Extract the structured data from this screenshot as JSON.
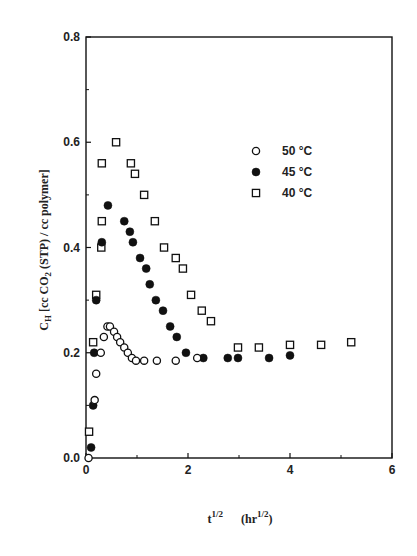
{
  "chart_data": {
    "type": "scatter",
    "title": "",
    "xlabel": "t^1/2 (hr^1/2)",
    "xlabel_parts": {
      "base": "t",
      "sup1": "1/2",
      "unit_base": "(hr",
      "sup2": "1/2",
      "unit_close": ")"
    },
    "ylabel": "C_H [cc CO2 (STP) / cc polymer]",
    "ylabel_parts": {
      "sym": "C",
      "sub": "H",
      "rest": " [cc CO",
      "sub2": "2",
      "rest2": " (STP) / cc polymer]"
    },
    "xlim": [
      0,
      6
    ],
    "ylim": [
      0.0,
      0.8
    ],
    "x_ticks": [
      0,
      2,
      4,
      6
    ],
    "x_minor_ticks": [
      1,
      3,
      5
    ],
    "y_ticks": [
      0.0,
      0.2,
      0.4,
      0.6,
      0.8
    ],
    "y_tick_labels": [
      "0.0",
      "0.2",
      "0.4",
      "0.6",
      "0.8"
    ],
    "y_minor_ticks": [
      0.1,
      0.3,
      0.5,
      0.7
    ],
    "grid": false,
    "legend_position": "upper right (inside)",
    "series": [
      {
        "name": "50 °C",
        "marker": "open-circle",
        "x": [
          0.05,
          0.17,
          0.2,
          0.29,
          0.35,
          0.42,
          0.47,
          0.55,
          0.61,
          0.67,
          0.75,
          0.82,
          0.9,
          0.98,
          1.14,
          1.39,
          1.76,
          2.18
        ],
        "y": [
          0.0,
          0.11,
          0.16,
          0.2,
          0.23,
          0.25,
          0.25,
          0.24,
          0.23,
          0.22,
          0.21,
          0.2,
          0.19,
          0.185,
          0.185,
          0.185,
          0.185,
          0.19
        ]
      },
      {
        "name": "45 °C",
        "marker": "filled-circle",
        "x": [
          0.1,
          0.14,
          0.16,
          0.2,
          0.31,
          0.43,
          0.75,
          0.86,
          0.92,
          1.06,
          1.18,
          1.25,
          1.37,
          1.51,
          1.65,
          1.78,
          1.96,
          2.3,
          2.78,
          2.98,
          3.59,
          4.0
        ],
        "y": [
          0.02,
          0.1,
          0.2,
          0.3,
          0.41,
          0.48,
          0.45,
          0.43,
          0.41,
          0.38,
          0.36,
          0.33,
          0.3,
          0.28,
          0.25,
          0.23,
          0.2,
          0.19,
          0.19,
          0.19,
          0.19,
          0.195
        ]
      },
      {
        "name": "40 °C",
        "marker": "open-square",
        "x": [
          0.06,
          0.14,
          0.2,
          0.3,
          0.31,
          0.31,
          0.59,
          0.88,
          0.96,
          1.14,
          1.35,
          1.53,
          1.76,
          1.9,
          2.06,
          2.27,
          2.45,
          2.98,
          3.39,
          4.0,
          4.61,
          5.2
        ],
        "y": [
          0.05,
          0.22,
          0.31,
          0.4,
          0.45,
          0.56,
          0.6,
          0.56,
          0.54,
          0.5,
          0.45,
          0.4,
          0.38,
          0.36,
          0.31,
          0.28,
          0.26,
          0.21,
          0.21,
          0.215,
          0.215,
          0.22
        ]
      }
    ],
    "legend": [
      {
        "label": "50 °C",
        "marker": "open-circle"
      },
      {
        "label": "45 °C",
        "marker": "filled-circle"
      },
      {
        "label": "40 °C",
        "marker": "open-square"
      }
    ]
  },
  "legend_labels": [
    "50 °C",
    "45 °C",
    "40 °C"
  ],
  "ink_color": "#111111",
  "background_color": "#ffffff"
}
